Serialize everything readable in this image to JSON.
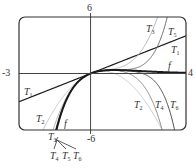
{
  "chart_data": {
    "type": "line",
    "title": "",
    "xlabel": "",
    "ylabel": "",
    "xlim": [
      -3,
      4
    ],
    "ylim": [
      -6,
      6
    ],
    "grid": false,
    "axis_tick_labels": {
      "x_min": "-3",
      "x_max": "4",
      "y_max": "6",
      "y_min": "-6"
    },
    "function": "f(x) = x e^(-x)",
    "series": [
      {
        "name": "f",
        "label": "f",
        "coeffs": [
          0,
          1,
          -1,
          0.5,
          -0.16667,
          0.041667,
          -0.0083333
        ],
        "exact": true,
        "color": "#1a1a1a",
        "width": 2.0
      },
      {
        "name": "T1",
        "label": "T",
        "sub": "1",
        "coeffs": [
          0,
          1
        ],
        "color": "#1a1a1a",
        "width": 1.2
      },
      {
        "name": "T2",
        "label": "T",
        "sub": "2",
        "coeffs": [
          0,
          1,
          -1
        ],
        "color": "#c8c8c8",
        "width": 1.0
      },
      {
        "name": "T3",
        "label": "T",
        "sub": "3",
        "coeffs": [
          0,
          1,
          -1,
          0.5
        ],
        "color": "#b4b4b4",
        "width": 1.0
      },
      {
        "name": "T4",
        "label": "T",
        "sub": "4",
        "coeffs": [
          0,
          1,
          -1,
          0.5,
          -0.16667
        ],
        "color": "#8a8a8a",
        "width": 1.0
      },
      {
        "name": "T5",
        "label": "T",
        "sub": "5",
        "coeffs": [
          0,
          1,
          -1,
          0.5,
          -0.16667,
          0.041667
        ],
        "color": "#6e6e6e",
        "width": 1.0
      },
      {
        "name": "T6",
        "label": "T",
        "sub": "6",
        "coeffs": [
          0,
          1,
          -1,
          0.5,
          -0.16667,
          0.041667,
          -0.0083333
        ],
        "color": "#4a4a4a",
        "width": 1.0
      }
    ],
    "annotations": [
      {
        "text": "T",
        "sub": "3",
        "x": 146,
        "y": 24
      },
      {
        "text": "T",
        "sub": "5",
        "x": 168,
        "y": 27
      },
      {
        "text": "T",
        "sub": "1",
        "x": 171,
        "y": 45
      },
      {
        "text": "f",
        "sub": "",
        "x": 168,
        "y": 61
      },
      {
        "text": "T",
        "sub": "1",
        "x": 24,
        "y": 87
      },
      {
        "text": "T",
        "sub": "2",
        "x": 134,
        "y": 100
      },
      {
        "text": "T",
        "sub": "4",
        "x": 155,
        "y": 100
      },
      {
        "text": "T",
        "sub": "6",
        "x": 170,
        "y": 100
      },
      {
        "text": "T",
        "sub": "2",
        "x": 36,
        "y": 114
      },
      {
        "text": "f",
        "sub": "",
        "x": 64,
        "y": 119
      },
      {
        "text": "T",
        "sub": "3",
        "x": 48,
        "y": 132
      },
      {
        "text": "T",
        "sub": "4",
        "x": 50,
        "y": 151
      },
      {
        "text": "T",
        "sub": "5",
        "x": 62,
        "y": 151
      },
      {
        "text": "T",
        "sub": "6",
        "x": 73,
        "y": 151
      }
    ]
  },
  "frame": {
    "left": 19,
    "right": 186,
    "top": 17,
    "bottom": 130,
    "radius": 6,
    "stroke": "#333333"
  }
}
